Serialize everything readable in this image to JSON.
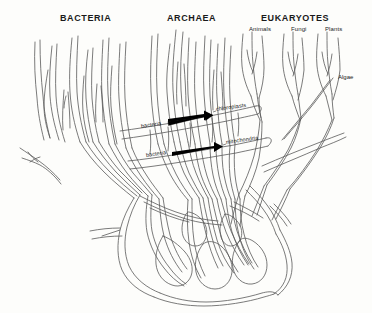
{
  "figure": {
    "title_visible": false,
    "background_color": "#fdfdfb",
    "ink_color": "#4a4a4a",
    "text_color": "#1a1a1a",
    "arrow_color": "#000000",
    "width": 372,
    "height": 313
  },
  "domains": [
    {
      "id": "bacteria",
      "label": "BACTERIA",
      "x": 60,
      "y": 14
    },
    {
      "id": "archaea",
      "label": "ARCHAEA",
      "x": 167,
      "y": 14
    },
    {
      "id": "eukaryotes",
      "label": "EUKARYOTES",
      "x": 261,
      "y": 14
    }
  ],
  "eukaryote_groups": [
    {
      "id": "animals",
      "label": "Animals",
      "x": 249,
      "y": 26
    },
    {
      "id": "fungi",
      "label": "Fungi",
      "x": 291,
      "y": 26
    },
    {
      "id": "plants",
      "label": "Plants",
      "x": 325,
      "y": 26
    }
  ],
  "side_labels": [
    {
      "id": "algae",
      "label": "Algae",
      "x": 338,
      "y": 76
    }
  ],
  "endosymbiosis_events": [
    {
      "id": "chloroplast-event",
      "source_label": "bacteria",
      "target_label": "chloroplasts",
      "source_x": 141,
      "source_y": 124,
      "target_x": 216,
      "target_y": 110,
      "arrow_start_x": 168,
      "arrow_start_y": 119,
      "arrow_end_x": 212,
      "arrow_end_y": 113
    },
    {
      "id": "mitochondria-event",
      "source_label": "bacteria",
      "target_label": "mitochondria",
      "source_x": 146,
      "source_y": 153,
      "target_x": 226,
      "target_y": 143,
      "arrow_start_x": 172,
      "arrow_start_y": 150,
      "arrow_end_x": 222,
      "arrow_end_y": 144
    }
  ],
  "diagram": {
    "type": "reticulated-phylogenetic-tree",
    "description_visible": false,
    "branch_style": "hand-drawn-outline",
    "root_style": "tangled-network"
  }
}
